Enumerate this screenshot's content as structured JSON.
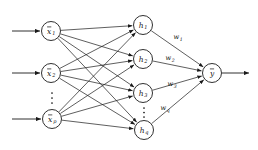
{
  "diagram": {
    "type": "neural-network-architecture",
    "title": "",
    "layers": {
      "input": {
        "name": "input-layer",
        "nodes": [
          {
            "id": "x1",
            "base": "x",
            "sub": "1",
            "overbar": true,
            "cx": 51,
            "cy": 31,
            "r": 9.5
          },
          {
            "id": "x2",
            "base": "x",
            "sub": "2",
            "overbar": true,
            "cx": 51,
            "cy": 73,
            "r": 9.5
          },
          {
            "id": "xp",
            "base": "x",
            "sub": "p",
            "overbar": true,
            "cx": 52,
            "cy": 119,
            "r": 9.5
          }
        ],
        "ellipsis": {
          "cx": 52,
          "cy_top": 93,
          "cy_bottom": 103,
          "dots": 3
        },
        "incoming_arrows": [
          {
            "x1": 12,
            "y1": 31,
            "x2": 40,
            "y2": 31
          },
          {
            "x1": 12,
            "y1": 73,
            "x2": 40,
            "y2": 73
          },
          {
            "x1": 12,
            "y1": 119,
            "x2": 41,
            "y2": 119
          }
        ]
      },
      "hidden": {
        "name": "hidden-layer",
        "nodes": [
          {
            "id": "h1",
            "base": "h",
            "sub": "1",
            "overbar": false,
            "cx": 143,
            "cy": 25,
            "r": 9.5
          },
          {
            "id": "h2",
            "base": "h",
            "sub": "2",
            "overbar": false,
            "cx": 143,
            "cy": 59,
            "r": 9.5
          },
          {
            "id": "h3",
            "base": "h",
            "sub": "3",
            "overbar": false,
            "cx": 143,
            "cy": 93,
            "r": 9.5
          },
          {
            "id": "hq",
            "base": "h",
            "sub": "q",
            "overbar": false,
            "cx": 144,
            "cy": 130,
            "r": 9.5
          }
        ],
        "ellipsis": {
          "cx": 144,
          "cy_top": 108,
          "cy_bottom": 117,
          "dots": 3
        }
      },
      "output": {
        "name": "output-layer",
        "nodes": [
          {
            "id": "y",
            "base": "y",
            "sub": "",
            "overbar": true,
            "cx": 212,
            "cy": 73,
            "r": 9.5
          }
        ],
        "outgoing_arrow": {
          "x1": 222,
          "y1": 73,
          "x2": 249,
          "y2": 73
        }
      }
    },
    "weights": [
      {
        "id": "w1",
        "base": "w",
        "sub": "1",
        "x": 178,
        "y": 37
      },
      {
        "id": "w2",
        "base": "w",
        "sub": "2",
        "x": 170,
        "y": 58
      },
      {
        "id": "w3",
        "base": "w",
        "sub": "3",
        "x": 172,
        "y": 84
      },
      {
        "id": "wq",
        "base": "w",
        "sub": "q",
        "x": 165,
        "y": 108
      }
    ],
    "colors": {
      "stroke": "#1a1a1a",
      "text": "#111111",
      "background": "#ffffff"
    },
    "edges_input_to_hidden": [
      {
        "from": "x1",
        "to": "h1"
      },
      {
        "from": "x1",
        "to": "h2"
      },
      {
        "from": "x1",
        "to": "h3"
      },
      {
        "from": "x1",
        "to": "hq"
      },
      {
        "from": "x2",
        "to": "h1"
      },
      {
        "from": "x2",
        "to": "h2"
      },
      {
        "from": "x2",
        "to": "h3"
      },
      {
        "from": "x2",
        "to": "hq"
      },
      {
        "from": "xp",
        "to": "h1"
      },
      {
        "from": "xp",
        "to": "h2"
      },
      {
        "from": "xp",
        "to": "h3"
      },
      {
        "from": "xp",
        "to": "hq"
      }
    ],
    "edges_hidden_to_output": [
      {
        "from": "h1",
        "to": "y",
        "weight": "w1"
      },
      {
        "from": "h2",
        "to": "y",
        "weight": "w2"
      },
      {
        "from": "h3",
        "to": "y",
        "weight": "w3"
      },
      {
        "from": "hq",
        "to": "y",
        "weight": "wq"
      }
    ]
  }
}
